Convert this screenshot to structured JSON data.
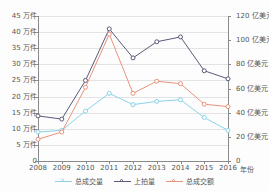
{
  "chart_data": {
    "type": "line",
    "title": "",
    "xlabel": "年份",
    "ylabel_left": "万件",
    "ylabel_right": "亿美元",
    "grid": true,
    "legend_position": "bottom",
    "categories": [
      "2008",
      "2009",
      "2010",
      "2011",
      "2012",
      "2013",
      "2014",
      "2015",
      "2016"
    ],
    "left_axis": {
      "unit": "万件",
      "ylim": [
        0,
        45
      ],
      "ticks": [
        0,
        5,
        10,
        15,
        20,
        25,
        30,
        35,
        40,
        45
      ],
      "tick_labels": [
        "0",
        "5 万件",
        "10 万件",
        "15 万件",
        "20 万件",
        "25 万件",
        "30 万件",
        "35 万件",
        "40 万件",
        "45 万件"
      ]
    },
    "right_axis": {
      "unit": "亿美元",
      "ylim": [
        0,
        120
      ],
      "ticks": [
        0,
        20,
        40,
        60,
        80,
        100,
        120
      ],
      "tick_labels": [
        "0",
        "20 亿美元",
        "40 亿美元",
        "60 亿美元",
        "80 亿美元",
        "100 亿美元",
        "120 亿美元"
      ]
    },
    "series": [
      {
        "name": "总成交量",
        "axis": "left",
        "unit": "万件",
        "color": "#8ad3e8",
        "values": [
          9.0,
          9.5,
          15.5,
          21.0,
          17.5,
          18.5,
          19.0,
          13.5,
          9.5
        ]
      },
      {
        "name": "上拍量",
        "axis": "left",
        "unit": "万件",
        "color": "#5a5a78",
        "values": [
          14.0,
          13.0,
          25.0,
          41.0,
          32.0,
          37.0,
          38.5,
          28.0,
          25.5
        ]
      },
      {
        "name": "总成交额",
        "axis": "right",
        "unit": "亿美元",
        "color": "#e8937c",
        "values": [
          18.0,
          24.0,
          61.0,
          105.0,
          56.0,
          66.0,
          64.0,
          47.0,
          45.0
        ]
      }
    ]
  },
  "legend": {
    "items": [
      {
        "label": "总成交量",
        "color": "#8ad3e8"
      },
      {
        "label": "上拍量",
        "color": "#5a5a78"
      },
      {
        "label": "总成交额",
        "color": "#e8937c"
      }
    ]
  }
}
